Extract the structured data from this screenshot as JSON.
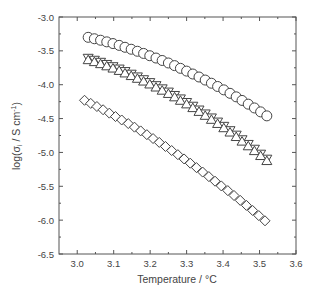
{
  "chart_data": {
    "type": "scatter",
    "title": "",
    "xlabel": "Temperature / °C",
    "ylabel": "log(σi / S cm-1)",
    "ylabel_parts": {
      "prefix": "log(σ",
      "sub": "i",
      "middle": " / S cm",
      "sup": "-1",
      "suffix": ")"
    },
    "xlim": [
      2.95,
      3.6
    ],
    "ylim": [
      -6.5,
      -3.0
    ],
    "xticks": [
      "3.0",
      "3.1",
      "3.2",
      "3.3",
      "3.4",
      "3.5",
      "3.6"
    ],
    "xtick_values": [
      3.0,
      3.1,
      3.2,
      3.3,
      3.4,
      3.5,
      3.6
    ],
    "yticks": [
      "-3.0",
      "-3.5",
      "-4.0",
      "-4.5",
      "-5.0",
      "-5.5",
      "-6.0",
      "-6.5"
    ],
    "ytick_values": [
      -3.0,
      -3.5,
      -4.0,
      -4.5,
      -5.0,
      -5.5,
      -6.0,
      -6.5
    ],
    "grid": false,
    "legend": null,
    "series": [
      {
        "name": "circles",
        "marker": "circle",
        "x": [
          3.03,
          3.047,
          3.064,
          3.081,
          3.098,
          3.115,
          3.131,
          3.148,
          3.165,
          3.182,
          3.199,
          3.216,
          3.233,
          3.25,
          3.267,
          3.283,
          3.3,
          3.317,
          3.334,
          3.351,
          3.368,
          3.385,
          3.402,
          3.419,
          3.436,
          3.452,
          3.469,
          3.486,
          3.503,
          3.52
        ],
        "y": [
          -3.3,
          -3.321,
          -3.343,
          -3.367,
          -3.392,
          -3.419,
          -3.447,
          -3.476,
          -3.506,
          -3.538,
          -3.572,
          -3.606,
          -3.642,
          -3.679,
          -3.718,
          -3.758,
          -3.799,
          -3.842,
          -3.886,
          -3.931,
          -3.978,
          -4.026,
          -4.076,
          -4.127,
          -4.179,
          -4.232,
          -4.287,
          -4.343,
          -4.401,
          -4.46
        ]
      },
      {
        "name": "down-triangles",
        "marker": "triangle-down",
        "x": [
          3.03,
          3.047,
          3.064,
          3.081,
          3.098,
          3.115,
          3.131,
          3.148,
          3.165,
          3.182,
          3.199,
          3.216,
          3.233,
          3.25,
          3.267,
          3.283,
          3.3,
          3.317,
          3.334,
          3.351,
          3.368,
          3.385,
          3.402,
          3.419,
          3.436,
          3.452,
          3.469,
          3.486,
          3.503,
          3.52
        ],
        "y": [
          -3.61,
          -3.639,
          -3.669,
          -3.701,
          -3.734,
          -3.769,
          -3.806,
          -3.845,
          -3.885,
          -3.926,
          -3.969,
          -4.014,
          -4.061,
          -4.109,
          -4.159,
          -4.21,
          -4.263,
          -4.318,
          -4.374,
          -4.432,
          -4.491,
          -4.552,
          -4.615,
          -4.679,
          -4.745,
          -4.813,
          -4.882,
          -4.953,
          -5.026,
          -5.1
        ]
      },
      {
        "name": "up-triangles",
        "marker": "triangle-up",
        "x": [
          3.03,
          3.047,
          3.064,
          3.081,
          3.098,
          3.115,
          3.131,
          3.148,
          3.165,
          3.182,
          3.199,
          3.216,
          3.233,
          3.25,
          3.267,
          3.283,
          3.3,
          3.317,
          3.334,
          3.351,
          3.368,
          3.385,
          3.402,
          3.419,
          3.436,
          3.452,
          3.469,
          3.486,
          3.503,
          3.52
        ],
        "y": [
          -3.63,
          -3.659,
          -3.689,
          -3.721,
          -3.754,
          -3.789,
          -3.826,
          -3.865,
          -3.905,
          -3.946,
          -3.989,
          -4.034,
          -4.081,
          -4.129,
          -4.179,
          -4.23,
          -4.283,
          -4.338,
          -4.394,
          -4.452,
          -4.511,
          -4.572,
          -4.635,
          -4.699,
          -4.765,
          -4.833,
          -4.902,
          -4.973,
          -5.046,
          -5.12
        ]
      },
      {
        "name": "diamonds",
        "marker": "diamond",
        "x": [
          3.02,
          3.037,
          3.054,
          3.071,
          3.088,
          3.105,
          3.122,
          3.14,
          3.157,
          3.174,
          3.191,
          3.208,
          3.225,
          3.242,
          3.259,
          3.276,
          3.293,
          3.31,
          3.327,
          3.344,
          3.361,
          3.378,
          3.395,
          3.413,
          3.43,
          3.447,
          3.464,
          3.481,
          3.498,
          3.515
        ],
        "y": [
          -4.23,
          -4.276,
          -4.322,
          -4.37,
          -4.42,
          -4.47,
          -4.521,
          -4.574,
          -4.627,
          -4.682,
          -4.738,
          -4.795,
          -4.852,
          -4.912,
          -4.972,
          -5.033,
          -5.096,
          -5.159,
          -5.224,
          -5.29,
          -5.357,
          -5.425,
          -5.494,
          -5.564,
          -5.636,
          -5.708,
          -5.782,
          -5.857,
          -5.933,
          -6.01
        ]
      }
    ]
  },
  "style": {
    "axis_color": "#555555",
    "marker_stroke": "#444444",
    "marker_fill": "#ffffff",
    "text_color": "#444444"
  }
}
